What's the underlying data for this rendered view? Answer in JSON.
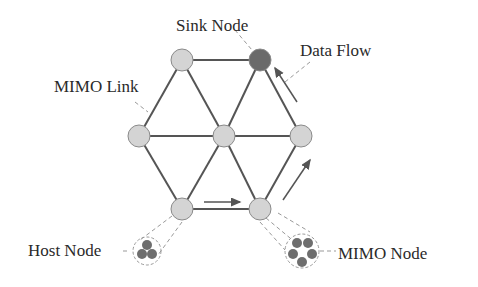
{
  "diagram": {
    "type": "hexagonal MIMO network topology",
    "labels": {
      "sink_node": "Sink Node",
      "data_flow": "Data Flow",
      "mimo_link": "MIMO Link",
      "host_node": "Host Node",
      "mimo_node": "MIMO Node"
    },
    "colors": {
      "node_fill": "#d4d4d4",
      "node_stroke": "#8a8a8a",
      "sink_fill": "#6a6a6a",
      "link": "#555555",
      "sub_node": "#6e6e6e",
      "dashed": "#999999",
      "text": "#2a2a2a"
    },
    "nodes": [
      {
        "id": "top-left",
        "x": 182,
        "y": 60,
        "type": "regular"
      },
      {
        "id": "sink",
        "x": 260,
        "y": 60,
        "type": "sink"
      },
      {
        "id": "left",
        "x": 139,
        "y": 136,
        "type": "regular"
      },
      {
        "id": "center",
        "x": 224,
        "y": 136,
        "type": "regular"
      },
      {
        "id": "right",
        "x": 301,
        "y": 136,
        "type": "regular"
      },
      {
        "id": "bottom-left",
        "x": 182,
        "y": 209,
        "type": "regular"
      },
      {
        "id": "bottom-right",
        "x": 260,
        "y": 209,
        "type": "regular"
      }
    ],
    "links": [
      [
        "top-left",
        "sink"
      ],
      [
        "top-left",
        "left"
      ],
      [
        "top-left",
        "center"
      ],
      [
        "sink",
        "center"
      ],
      [
        "sink",
        "right"
      ],
      [
        "left",
        "center"
      ],
      [
        "center",
        "right"
      ],
      [
        "left",
        "bottom-left"
      ],
      [
        "center",
        "bottom-left"
      ],
      [
        "center",
        "bottom-right"
      ],
      [
        "right",
        "bottom-right"
      ],
      [
        "bottom-left",
        "bottom-right"
      ]
    ],
    "data_flow_path": [
      "bottom-left",
      "bottom-right",
      "right",
      "sink"
    ],
    "host_node_subnodes": 3,
    "mimo_node_subnodes": 5
  }
}
